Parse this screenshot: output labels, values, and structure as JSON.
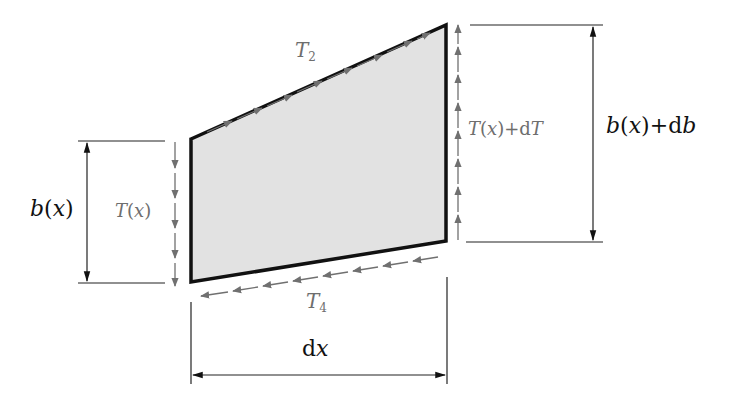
{
  "diagram": {
    "type": "free-body element (trapezoid) with shear flows",
    "colors": {
      "element_fill": "#e2e2e2",
      "element_stroke": "#111111",
      "shear_arrows": "#707070",
      "dimension_lines": "#222222",
      "label_black": "#111111",
      "label_grey": "#6e6e6e"
    },
    "labels": {
      "t2": {
        "base": "T",
        "sub": "2"
      },
      "t4": {
        "base": "T",
        "sub": "4"
      },
      "tx": {
        "func": "T",
        "open": "(",
        "var": "x",
        "close": ")"
      },
      "txdt": {
        "func": "T",
        "open": "(",
        "var": "x",
        "close": ")",
        "plus": "+d",
        "tail": "T"
      },
      "bx": {
        "func": "b",
        "open": "(",
        "var": "x",
        "close": ")"
      },
      "bxdb": {
        "func": "b",
        "open": "(",
        "var": "x",
        "close": ")",
        "plus": "+d",
        "tail": "b"
      },
      "dx": {
        "d": "d",
        "var": "x"
      }
    },
    "shape": {
      "top_left": [
        191,
        139
      ],
      "top_right": [
        446,
        25
      ],
      "bottom_right": [
        446,
        241
      ],
      "bottom_left": [
        191,
        282
      ]
    }
  }
}
